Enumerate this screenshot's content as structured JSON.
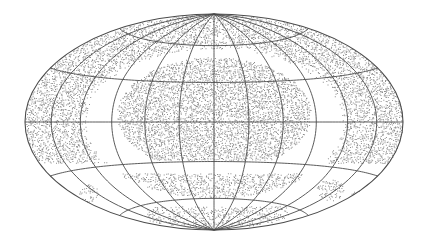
{
  "map": {
    "projection": "hammer",
    "canvas": {
      "width": 427,
      "height": 246,
      "background": "#ffffff"
    },
    "frame": {
      "cx": 214,
      "cy": 122,
      "rx": 189,
      "ry": 108
    },
    "graticule": {
      "meridian_step_deg": 30,
      "parallel_step_deg": 30,
      "line_color": "#4a4a4a",
      "line_width": 0.9
    },
    "points_style": {
      "color": "#7a7a7a",
      "size": 1.0,
      "opacity": 0.85
    },
    "regions": [
      {
        "name": "outer-ring-band",
        "type": "annulus",
        "r_inner": 0.68,
        "r_outer": 1.0,
        "v_max": 0.38,
        "density": 0.55
      },
      {
        "name": "central-dome",
        "type": "ellipse",
        "cx": 214,
        "cy": 114,
        "rx": 97,
        "ry": 57,
        "y_max": 160,
        "density": 0.6
      },
      {
        "name": "southern-band",
        "type": "rect-in-frame",
        "x0": 112,
        "x1": 302,
        "y0": 174,
        "y1": 204,
        "r_max": 0.7,
        "density": 0.5
      },
      {
        "name": "south-cap",
        "type": "rect-in-frame",
        "x0": 148,
        "x1": 288,
        "y0": 207,
        "y1": 230,
        "r_max": 0.98,
        "density": 0.4
      },
      {
        "name": "right-patch",
        "type": "ellipse",
        "cx": 330,
        "cy": 190,
        "rx": 14,
        "ry": 11,
        "y_max": 246,
        "density": 0.45
      },
      {
        "name": "right-edge-patch",
        "type": "ellipse",
        "cx": 360,
        "cy": 195,
        "rx": 10,
        "ry": 5,
        "y_max": 246,
        "density": 0.35
      },
      {
        "name": "left-patch",
        "type": "ellipse",
        "cx": 88,
        "cy": 193,
        "rx": 10,
        "ry": 9,
        "y_max": 246,
        "density": 0.4
      }
    ]
  }
}
